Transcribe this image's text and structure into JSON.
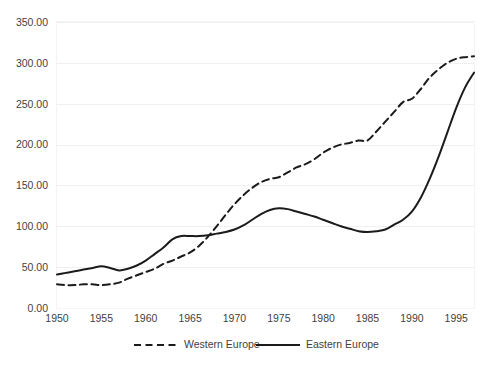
{
  "chart_data": {
    "type": "line",
    "title": "",
    "subtitle": "",
    "xlabel": "",
    "ylabel": "",
    "x": [
      1950,
      1951,
      1952,
      1953,
      1954,
      1955,
      1956,
      1957,
      1958,
      1959,
      1960,
      1961,
      1962,
      1963,
      1964,
      1965,
      1966,
      1967,
      1968,
      1969,
      1970,
      1971,
      1972,
      1973,
      1974,
      1975,
      1976,
      1977,
      1978,
      1979,
      1980,
      1981,
      1982,
      1983,
      1984,
      1985,
      1986,
      1987,
      1988,
      1989,
      1990,
      1991,
      1992,
      1993,
      1994,
      1995,
      1996,
      1997
    ],
    "series": [
      {
        "name": "Western Europe",
        "style": "dashed",
        "color": "#1b1b1b",
        "values": [
          29,
          28,
          28,
          29,
          29,
          28,
          29,
          31,
          36,
          40,
          44,
          48,
          54,
          58,
          63,
          68,
          76,
          87,
          100,
          114,
          127,
          138,
          147,
          154,
          158,
          160,
          166,
          172,
          176,
          182,
          190,
          196,
          200,
          202,
          205,
          205,
          216,
          228,
          240,
          252,
          256,
          268,
          282,
          292,
          300,
          305,
          307,
          308
        ]
      },
      {
        "name": "Eastern Europe",
        "style": "solid",
        "color": "#1b1b1b",
        "values": [
          41,
          43,
          45,
          47,
          49,
          51,
          49,
          46,
          48,
          52,
          58,
          66,
          74,
          84,
          88,
          88,
          88,
          89,
          91,
          93,
          96,
          101,
          108,
          115,
          120,
          122,
          121,
          118,
          115,
          112,
          108,
          104,
          100,
          97,
          94,
          93,
          94,
          96,
          102,
          108,
          118,
          135,
          158,
          185,
          215,
          245,
          270,
          288
        ]
      }
    ],
    "ylim": [
      0,
      350
    ],
    "xlim": [
      1950,
      1997
    ],
    "y_ticks": [
      0,
      50,
      100,
      150,
      200,
      250,
      300,
      350
    ],
    "y_tick_labels": [
      "0.00",
      "50.00",
      "100.00",
      "150.00",
      "200.00",
      "250.00",
      "300.00",
      "350.00"
    ],
    "x_ticks": [
      1950,
      1955,
      1960,
      1965,
      1970,
      1975,
      1980,
      1985,
      1990,
      1995
    ],
    "x_tick_labels": [
      "1950",
      "1955",
      "1960",
      "1965",
      "1970",
      "1975",
      "1980",
      "1985",
      "1990",
      "1995"
    ],
    "grid": "horizontal",
    "legend_position": "bottom",
    "legend": [
      "Western Europe",
      "Eastern Europe"
    ]
  }
}
